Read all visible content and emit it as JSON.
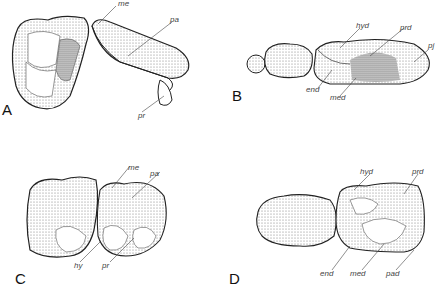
{
  "figure": {
    "panels": [
      {
        "letter": "A",
        "labels": {
          "me": "me",
          "pa": "pa",
          "pr": "pr"
        }
      },
      {
        "letter": "B",
        "labels": {
          "hyd": "hyd",
          "prd": "prd",
          "pj": "pj",
          "end": "end",
          "med": "med"
        }
      },
      {
        "letter": "C",
        "labels": {
          "me": "me",
          "pa": "pa",
          "hy": "hy",
          "pr": "pr"
        }
      },
      {
        "letter": "D",
        "labels": {
          "hyd": "hyd",
          "prd": "prd",
          "end": "end",
          "med": "med",
          "pad": "pad"
        }
      }
    ]
  }
}
